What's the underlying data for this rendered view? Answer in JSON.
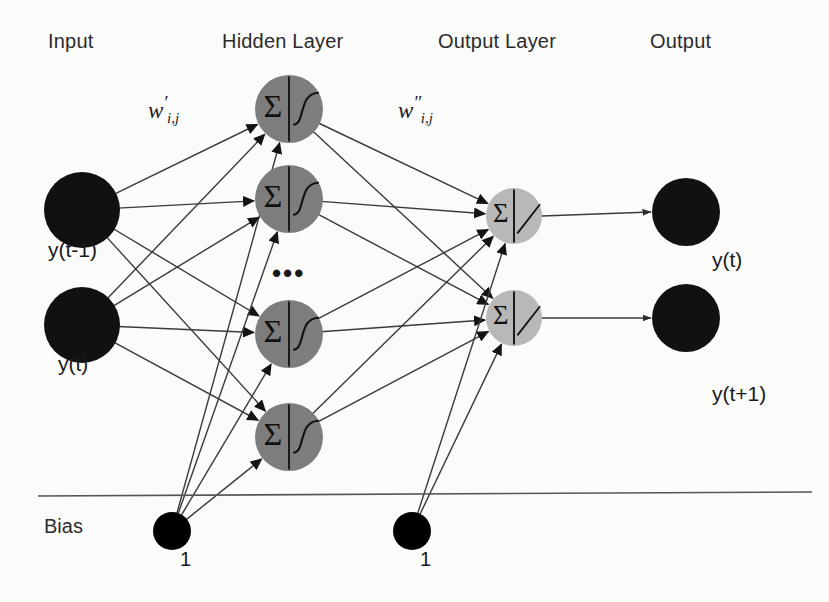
{
  "diagram": {
    "background_color": "#fbfbfa",
    "layer_titles": [
      {
        "key": "input",
        "label": "Input",
        "x": 48,
        "y": 30
      },
      {
        "key": "hidden",
        "label": "Hidden Layer",
        "x": 222,
        "y": 30
      },
      {
        "key": "output_layer",
        "label": "Output Layer",
        "x": 438,
        "y": 30
      },
      {
        "key": "output",
        "label": "Output",
        "x": 650,
        "y": 30
      }
    ],
    "weight_labels": [
      {
        "key": "w-prime",
        "base": "w",
        "prime": "′",
        "sub": "i,j",
        "x": 148,
        "y": 92
      },
      {
        "key": "w-double-prime",
        "base": "w",
        "prime": "″",
        "sub": "i,j",
        "x": 398,
        "y": 92
      }
    ],
    "ellipsis": {
      "text": "•••",
      "x": 272,
      "y": 258
    },
    "bias": {
      "label": "Bias",
      "label_x": 44,
      "label_y": 515,
      "line": {
        "x1": 38,
        "y1": 496,
        "x2": 812,
        "y2": 492
      },
      "nodes": [
        {
          "key": "bias-hidden",
          "value": "1",
          "cx": 172,
          "cy": 531,
          "r": 19,
          "label_x": 180,
          "label_y": 548
        },
        {
          "key": "bias-output",
          "value": "1",
          "cx": 412,
          "cy": 531,
          "r": 19,
          "label_x": 420,
          "label_y": 548
        }
      ]
    },
    "input_nodes": [
      {
        "key": "input-y-t-minus-1",
        "label": "y(t-1)",
        "cx": 82,
        "cy": 210,
        "r": 38,
        "color": "#111111",
        "label_x": 48,
        "label_y": 238
      },
      {
        "key": "input-y-t",
        "label": "y(t)",
        "cx": 82,
        "cy": 325,
        "r": 38,
        "color": "#111111",
        "label_x": 58,
        "label_y": 352
      }
    ],
    "hidden_nodes": [
      {
        "key": "hidden-1",
        "cx": 289,
        "cy": 109,
        "r": 34,
        "color": "#7d7d7d",
        "sigma": "Σ",
        "activation": "sigmoid"
      },
      {
        "key": "hidden-2",
        "cx": 289,
        "cy": 199,
        "r": 34,
        "color": "#7d7d7d",
        "sigma": "Σ",
        "activation": "sigmoid"
      },
      {
        "key": "hidden-3",
        "cx": 289,
        "cy": 334,
        "r": 34,
        "color": "#7d7d7d",
        "sigma": "Σ",
        "activation": "sigmoid"
      },
      {
        "key": "hidden-4",
        "cx": 289,
        "cy": 437,
        "r": 34,
        "color": "#7d7d7d",
        "sigma": "Σ",
        "activation": "sigmoid"
      }
    ],
    "output_layer_nodes": [
      {
        "key": "outlayer-1",
        "cx": 514,
        "cy": 216,
        "r": 28,
        "color": "#b8b8b8",
        "sigma": "Σ",
        "activation": "linear"
      },
      {
        "key": "outlayer-2",
        "cx": 514,
        "cy": 318,
        "r": 28,
        "color": "#b8b8b8",
        "sigma": "Σ",
        "activation": "linear"
      }
    ],
    "output_nodes": [
      {
        "key": "output-y-t",
        "label": "y(t)",
        "cx": 686,
        "cy": 212,
        "r": 34,
        "color": "#111111",
        "label_x": 712,
        "label_y": 248
      },
      {
        "key": "output-y-t-plus-1",
        "label": "y(t+1)",
        "cx": 686,
        "cy": 318,
        "r": 34,
        "color": "#111111",
        "label_x": 712,
        "label_y": 382
      }
    ],
    "edge_color": "#3a3a3a"
  }
}
